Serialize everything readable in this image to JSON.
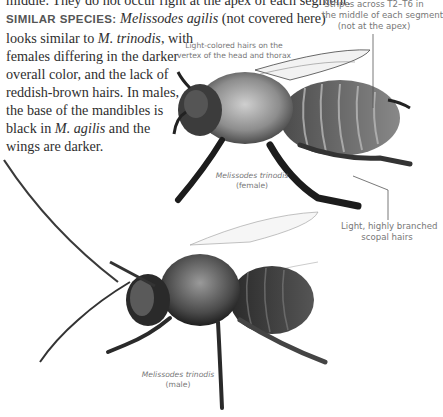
{
  "text_block": {
    "line0": "middle. They do not occur right at the apex of each segment.",
    "similar_label": "SIMILAR SPECIES:",
    "similar_species": "Melissodes agilis",
    "similar_note": "(not covered here)",
    "line2": "looks similar to ",
    "line2_species": "M. trinodis",
    "line2_end": ", with",
    "line3": "females differing in the darker",
    "line4": "overall color, and the lack of",
    "line5": "reddish-brown hairs. In males,",
    "line6": "the base of the mandibles is",
    "line7_start": "black in ",
    "line7_species": "M. agilis",
    "line7_end": " and the",
    "line8": "wings are darker."
  },
  "annotations": {
    "stripes": [
      "Stripes across T2–T6 in",
      "the middle of each segment",
      "(not at the apex)"
    ],
    "vertex": [
      "Light-colored hairs on the",
      "vertex of the head and thorax"
    ],
    "scopal": [
      "Light, highly branched",
      "scopal hairs"
    ]
  },
  "captions": {
    "female": {
      "species": "Melissodes trinodis",
      "sex": "(female)"
    },
    "male": {
      "species": "Melissodes trinodis",
      "sex": "(male)"
    }
  }
}
